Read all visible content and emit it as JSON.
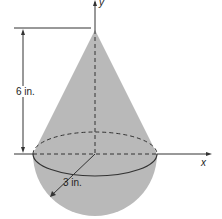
{
  "diagram": {
    "labels": {
      "y_axis": "y",
      "x_axis": "x",
      "height": "6 in.",
      "radius": "3 in."
    },
    "colors": {
      "fill": "#b9b9b9",
      "line": "#333333"
    }
  }
}
